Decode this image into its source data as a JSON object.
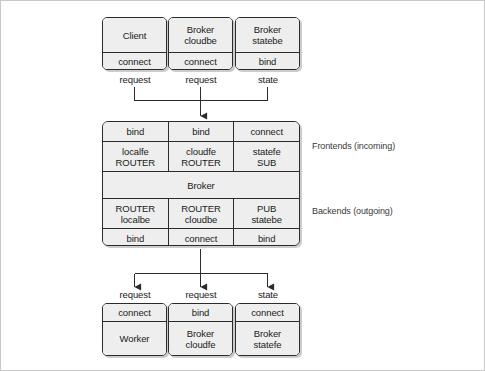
{
  "diagram": {
    "colors": {
      "box_fill": "#eeeeee",
      "box_border": "#2b2b2b",
      "canvas": "#ffffff",
      "frame": "#c9c9c9",
      "wire": "#2b2b2b"
    },
    "top_nodes": [
      {
        "name": "Client",
        "name_line2": "",
        "action": "connect",
        "edge_label": "request"
      },
      {
        "name": "Broker",
        "name_line2": "cloudbe",
        "action": "connect",
        "edge_label": "request"
      },
      {
        "name": "Broker",
        "name_line2": "statebe",
        "action": "bind",
        "edge_label": "state"
      }
    ],
    "broker": {
      "frontend_bind_row": [
        "bind",
        "bind",
        "connect"
      ],
      "frontend_socket_row": [
        {
          "line1": "localfe",
          "line2": "ROUTER"
        },
        {
          "line1": "cloudfe",
          "line2": "ROUTER"
        },
        {
          "line1": "statefe",
          "line2": "SUB"
        }
      ],
      "center_label": "Broker",
      "backend_socket_row": [
        {
          "line1": "ROUTER",
          "line2": "localbe"
        },
        {
          "line1": "ROUTER",
          "line2": "cloudbe"
        },
        {
          "line1": "PUB",
          "line2": "statebe"
        }
      ],
      "backend_bind_row": [
        "bind",
        "connect",
        "bind"
      ],
      "frontend_annotation": "Frontends (incoming)",
      "backend_annotation": "Backends (outgoing)"
    },
    "bottom_nodes": [
      {
        "edge_label": "request",
        "action": "connect",
        "name": "Worker",
        "name_line2": ""
      },
      {
        "edge_label": "request",
        "action": "bind",
        "name": "Broker",
        "name_line2": "cloudfe"
      },
      {
        "edge_label": "state",
        "action": "connect",
        "name": "Broker",
        "name_line2": "statefe"
      }
    ]
  }
}
